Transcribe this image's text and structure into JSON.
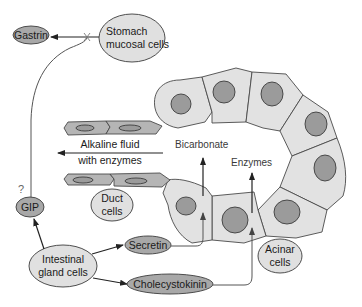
{
  "nodes": {
    "gastrin": "Gastrin",
    "stomach_line1": "Stomach",
    "stomach_line2": "mucosal cells",
    "gip": "GIP",
    "gip_question": "?",
    "intestinal_line1": "Intestinal",
    "intestinal_line2": "gland cells",
    "secretin": "Secretin",
    "cholecystokinin": "Cholecystokinin",
    "duct_line1": "Duct",
    "duct_line2": "cells",
    "acinar_line1": "Acinar",
    "acinar_line2": "cells"
  },
  "labels": {
    "alkaline_line1": "Alkaline fluid",
    "alkaline_line2": "with enzymes",
    "bicarbonate": "Bicarbonate",
    "enzymes": "Enzymes"
  },
  "colors": {
    "background": "#ffffff",
    "cell_fill": "#e2e2e2",
    "nucleus_fill": "#9b9b9b",
    "duct_fill": "#b5b5b5",
    "hormone_oval_fill": "#a8a8a8",
    "source_oval_fill": "#e0e0e0",
    "outline": "#3c3c3c"
  }
}
